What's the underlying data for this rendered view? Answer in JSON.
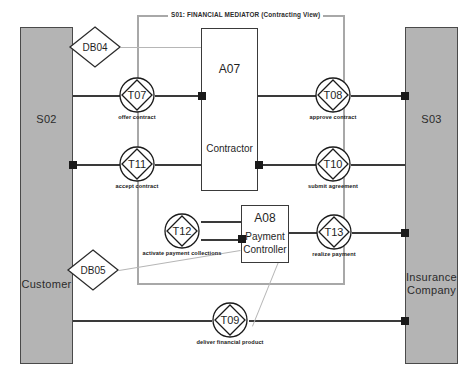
{
  "diagram": {
    "title": "S01: FINANCIAL MEDIATOR (Contracting View)",
    "type": "DEMO Construction Model (Actor Transaction Diagram)"
  },
  "scope": {
    "label": "S01: FINANCIAL MEDIATOR (Contracting View)"
  },
  "actors": {
    "left": {
      "id": "S02",
      "name": "Customer"
    },
    "right": {
      "id": "S03",
      "name": "Insurance Company"
    }
  },
  "roles": [
    {
      "id": "A07",
      "name": "Contractor"
    },
    {
      "id": "A08",
      "name": "Payment\nController",
      "line1": "Payment",
      "line2": "Controller"
    }
  ],
  "banks": [
    {
      "id": "DB04"
    },
    {
      "id": "DB05"
    }
  ],
  "transactions": [
    {
      "id": "T07",
      "caption": "offer contract"
    },
    {
      "id": "T08",
      "caption": "approve contract"
    },
    {
      "id": "T11",
      "caption": "accept contract"
    },
    {
      "id": "T10",
      "caption": "submit agreement"
    },
    {
      "id": "T12",
      "caption": "activate payment collections"
    },
    {
      "id": "T13",
      "caption": "realize payment"
    },
    {
      "id": "T09",
      "caption": "deliver financial product"
    }
  ],
  "colors": {
    "actor_fill": "#b4b4b4",
    "actor_stroke": "#4a4a4a",
    "scope_stroke": "#a8a8a8",
    "line": "#3a3a3a",
    "bank_line": "#b6b6b6",
    "initiator": "#1a1a1a"
  }
}
